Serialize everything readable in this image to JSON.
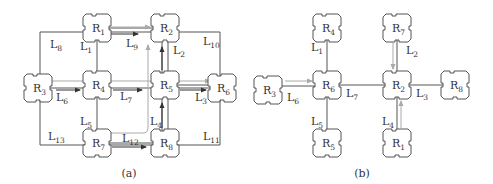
{
  "panel_a": {
    "caption": "(a)",
    "nodes": [
      {
        "id": "R1",
        "base": "R",
        "sub": "1",
        "x": 97,
        "y": 28
      },
      {
        "id": "R2",
        "base": "R",
        "sub": "2",
        "x": 165,
        "y": 28
      },
      {
        "id": "R3",
        "base": "R",
        "sub": "3",
        "x": 38,
        "y": 88
      },
      {
        "id": "R4",
        "base": "R",
        "sub": "4",
        "x": 97,
        "y": 85
      },
      {
        "id": "R5",
        "base": "R",
        "sub": "5",
        "x": 165,
        "y": 85
      },
      {
        "id": "R6",
        "base": "R",
        "sub": "6",
        "x": 222,
        "y": 88
      },
      {
        "id": "R7",
        "base": "R",
        "sub": "7",
        "x": 97,
        "y": 143
      },
      {
        "id": "R8",
        "base": "R",
        "sub": "8",
        "x": 165,
        "y": 143
      }
    ],
    "links": [
      {
        "base": "L",
        "sub": "8",
        "x": 50,
        "y": 48
      },
      {
        "base": "L",
        "sub": "1",
        "x": 80,
        "y": 50
      },
      {
        "base": "L",
        "sub": "9",
        "x": 126,
        "y": 47
      },
      {
        "base": "L",
        "sub": "2",
        "x": 173,
        "y": 54
      },
      {
        "base": "L",
        "sub": "10",
        "x": 203,
        "y": 45
      },
      {
        "base": "L",
        "sub": "6",
        "x": 56,
        "y": 101
      },
      {
        "base": "L",
        "sub": "7",
        "x": 120,
        "y": 100
      },
      {
        "base": "L",
        "sub": "3",
        "x": 195,
        "y": 101
      },
      {
        "base": "L",
        "sub": "5",
        "x": 80,
        "y": 125
      },
      {
        "base": "L",
        "sub": "4",
        "x": 150,
        "y": 125
      },
      {
        "base": "L",
        "sub": "13",
        "x": 48,
        "y": 140
      },
      {
        "base": "L",
        "sub": "12",
        "x": 122,
        "y": 142
      },
      {
        "base": "L",
        "sub": "11",
        "x": 203,
        "y": 140
      }
    ]
  },
  "panel_b": {
    "caption": "(b)",
    "nodes": [
      {
        "id": "R4",
        "base": "R",
        "sub": "4",
        "x": 327,
        "y": 28
      },
      {
        "id": "R7",
        "base": "R",
        "sub": "7",
        "x": 397,
        "y": 28
      },
      {
        "id": "R3",
        "base": "R",
        "sub": "3",
        "x": 268,
        "y": 90
      },
      {
        "id": "R6",
        "base": "R",
        "sub": "6",
        "x": 327,
        "y": 85
      },
      {
        "id": "R2",
        "base": "R",
        "sub": "2",
        "x": 397,
        "y": 85
      },
      {
        "id": "R8",
        "base": "R",
        "sub": "8",
        "x": 455,
        "y": 85
      },
      {
        "id": "R5",
        "base": "R",
        "sub": "5",
        "x": 327,
        "y": 143
      },
      {
        "id": "R1",
        "base": "R",
        "sub": "1",
        "x": 397,
        "y": 143
      }
    ],
    "links": [
      {
        "base": "L",
        "sub": "1",
        "x": 311,
        "y": 51
      },
      {
        "base": "L",
        "sub": "2",
        "x": 406,
        "y": 54
      },
      {
        "base": "L",
        "sub": "6",
        "x": 287,
        "y": 101
      },
      {
        "base": "L",
        "sub": "7",
        "x": 346,
        "y": 97
      },
      {
        "base": "L",
        "sub": "3",
        "x": 416,
        "y": 97
      },
      {
        "base": "L",
        "sub": "5",
        "x": 311,
        "y": 125
      },
      {
        "base": "L",
        "sub": "4",
        "x": 382,
        "y": 125
      }
    ]
  }
}
